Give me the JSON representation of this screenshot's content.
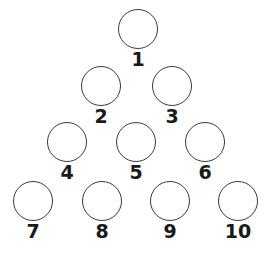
{
  "figure": {
    "width": 273,
    "height": 253,
    "background_color": "#ffffff",
    "circle_stroke_color": "#3a3a3a",
    "circle_fill_color": "#ffffff",
    "circle_stroke_width": 1.3,
    "circle_diameter": 40,
    "label_color": "#1a1a1a",
    "label_font_size": 19,
    "rows": 4,
    "node_count": 10
  },
  "nodes": [
    {
      "label": "1",
      "row": 1,
      "index_in_row": 1,
      "cx": 138,
      "cy": 29,
      "d": 40,
      "label_x": 138,
      "label_y": 50
    },
    {
      "label": "2",
      "row": 2,
      "index_in_row": 1,
      "cx": 101,
      "cy": 86,
      "d": 40,
      "label_x": 101,
      "label_y": 107
    },
    {
      "label": "3",
      "row": 2,
      "index_in_row": 2,
      "cx": 172,
      "cy": 86,
      "d": 40,
      "label_x": 172,
      "label_y": 107
    },
    {
      "label": "4",
      "row": 3,
      "index_in_row": 1,
      "cx": 67,
      "cy": 142,
      "d": 40,
      "label_x": 67,
      "label_y": 163
    },
    {
      "label": "5",
      "row": 3,
      "index_in_row": 2,
      "cx": 136,
      "cy": 142,
      "d": 40,
      "label_x": 136,
      "label_y": 163
    },
    {
      "label": "6",
      "row": 3,
      "index_in_row": 3,
      "cx": 205,
      "cy": 142,
      "d": 40,
      "label_x": 205,
      "label_y": 163
    },
    {
      "label": "7",
      "row": 4,
      "index_in_row": 1,
      "cx": 33,
      "cy": 201,
      "d": 40,
      "label_x": 33,
      "label_y": 222
    },
    {
      "label": "8",
      "row": 4,
      "index_in_row": 2,
      "cx": 102,
      "cy": 201,
      "d": 40,
      "label_x": 102,
      "label_y": 222
    },
    {
      "label": "9",
      "row": 4,
      "index_in_row": 3,
      "cx": 170,
      "cy": 201,
      "d": 40,
      "label_x": 170,
      "label_y": 222
    },
    {
      "label": "10",
      "row": 4,
      "index_in_row": 4,
      "cx": 238,
      "cy": 201,
      "d": 40,
      "label_x": 238,
      "label_y": 222
    }
  ]
}
